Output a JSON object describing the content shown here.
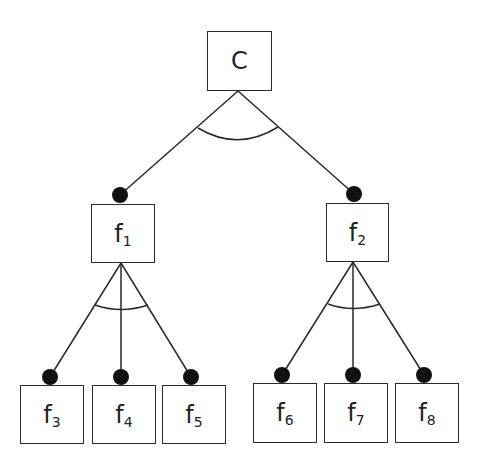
{
  "diagram": {
    "type": "feature-tree",
    "root": {
      "id": "C",
      "label": "C",
      "sub": ""
    },
    "nodes": [
      {
        "id": "C",
        "label": "C",
        "sub": "",
        "x": 207,
        "y": 31,
        "w": 65,
        "h": 60
      },
      {
        "id": "f1",
        "label": "f",
        "sub": "1",
        "x": 91,
        "y": 204,
        "w": 64,
        "h": 59
      },
      {
        "id": "f2",
        "label": "f",
        "sub": "2",
        "x": 326,
        "y": 203,
        "w": 63,
        "h": 59
      },
      {
        "id": "f3",
        "label": "f",
        "sub": "3",
        "x": 20,
        "y": 385,
        "w": 64,
        "h": 59
      },
      {
        "id": "f4",
        "label": "f",
        "sub": "4",
        "x": 92,
        "y": 385,
        "w": 64,
        "h": 59
      },
      {
        "id": "f5",
        "label": "f",
        "sub": "5",
        "x": 162,
        "y": 385,
        "w": 64,
        "h": 59
      },
      {
        "id": "f6",
        "label": "f",
        "sub": "6",
        "x": 253,
        "y": 383,
        "w": 64,
        "h": 60
      },
      {
        "id": "f7",
        "label": "f",
        "sub": "7",
        "x": 324,
        "y": 383,
        "w": 64,
        "h": 60
      },
      {
        "id": "f8",
        "label": "f",
        "sub": "8",
        "x": 395,
        "y": 383,
        "w": 64,
        "h": 60
      }
    ],
    "edges": [
      {
        "from": "C",
        "to": "f1",
        "mandatory": true
      },
      {
        "from": "C",
        "to": "f2",
        "mandatory": true
      },
      {
        "from": "f1",
        "to": "f3",
        "mandatory": true
      },
      {
        "from": "f1",
        "to": "f4",
        "mandatory": true
      },
      {
        "from": "f1",
        "to": "f5",
        "mandatory": true
      },
      {
        "from": "f2",
        "to": "f6",
        "mandatory": true
      },
      {
        "from": "f2",
        "to": "f7",
        "mandatory": true
      },
      {
        "from": "f2",
        "to": "f8",
        "mandatory": true
      }
    ],
    "groups": [
      {
        "parent": "C",
        "kind": "and-arc"
      },
      {
        "parent": "f1",
        "kind": "and-arc"
      },
      {
        "parent": "f2",
        "kind": "and-arc"
      }
    ],
    "colors": {
      "line": "#2a2a2a",
      "dot": "#111111",
      "background": "#ffffff"
    }
  }
}
